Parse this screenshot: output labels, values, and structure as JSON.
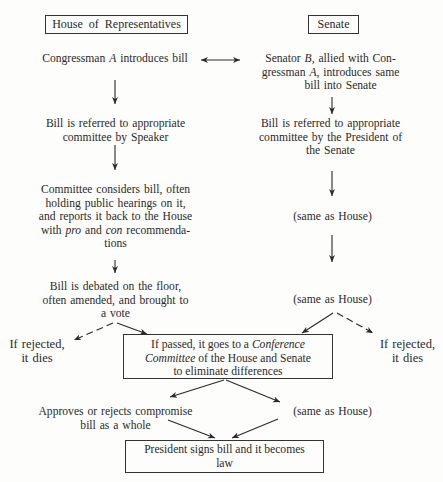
{
  "headers": {
    "house": "House of Representatives",
    "senate": "Senate"
  },
  "house": {
    "step1": "Congressman A introduces bill",
    "step1_parts": [
      "Congressman ",
      "A",
      " introduces bill"
    ],
    "step2_lines": [
      "Bill is referred to appropriate",
      "committee by Speaker"
    ],
    "step3_lines": [
      "Committee considers bill, often",
      "holding public hearings on it,",
      "and reports it back to the House"
    ],
    "step3_last": [
      "with ",
      "pro",
      " and ",
      "con",
      " recommenda-"
    ],
    "step3_end": "tions",
    "step4_lines": [
      "Bill is debated on the floor,",
      "often amended, and brought to",
      "a vote"
    ],
    "rejected_lines": [
      "If rejected,",
      "it dies"
    ]
  },
  "senate": {
    "step1_line1": [
      "Senator ",
      "B",
      ", allied with Con-"
    ],
    "step1_line2": [
      "gressman ",
      "A",
      ", introduces same"
    ],
    "step1_line3": "bill into Senate",
    "step2_lines": [
      "Bill is referred to appropriate",
      "committee by the President of",
      "the Senate"
    ],
    "step3": "(same as House)",
    "step4": "(same as House)",
    "rejected_lines": [
      "If rejected,",
      "it dies"
    ]
  },
  "conference": {
    "line1": [
      "If passed, it goes to a ",
      "Conference"
    ],
    "line2": [
      "Committee",
      " of the House and Senate"
    ],
    "line3": "to eliminate differences"
  },
  "compromise": {
    "house_lines": [
      "Approves or rejects compromise",
      "bill as a whole"
    ],
    "senate": "(same as House)"
  },
  "final": {
    "lines": [
      "President signs bill and it becomes",
      "law"
    ]
  },
  "colors": {
    "ink": "#2a2a2a",
    "paper": "#fdfdfc"
  }
}
